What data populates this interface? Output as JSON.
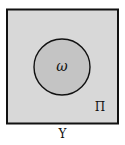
{
  "diagram": {
    "type": "set-diagram",
    "outer_set": {
      "label": "Π",
      "fill": "#d8d8d8",
      "stroke": "#111111"
    },
    "inner_set": {
      "label": "ω",
      "fill": "#c4c4c4",
      "stroke": "#111111"
    },
    "caption": "Υ"
  }
}
